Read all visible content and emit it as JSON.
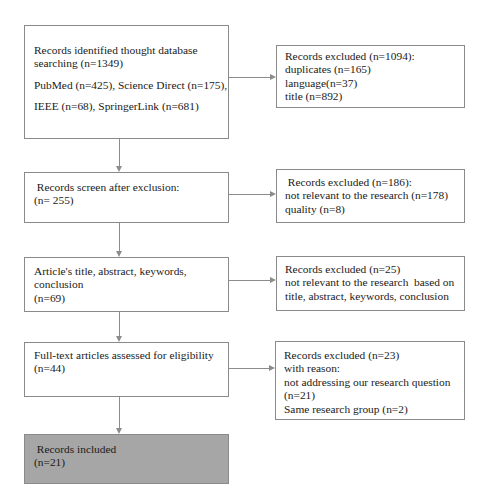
{
  "diagram": {
    "type": "PRISMA flow diagram",
    "main_flow": [
      {
        "id": "identified",
        "lines": [
          "Records identified thought database",
          "searching (n=1349)",
          "PubMed (n=425), Science Direct (n=175),",
          "IEEE (n=68), SpringerLink (n=681)"
        ],
        "filled": false
      },
      {
        "id": "screened",
        "lines": [
          " Records screen after exclusion:",
          "(n= 255)"
        ],
        "filled": false
      },
      {
        "id": "title-abstract",
        "lines": [
          "Article's title, abstract, keywords,",
          "conclusion",
          "(n=69)"
        ],
        "filled": false
      },
      {
        "id": "full-text",
        "lines": [
          "Full-text articles assessed for eligibility",
          "(n=44)"
        ],
        "filled": false
      },
      {
        "id": "included",
        "lines": [
          " Records included",
          "(n=21)"
        ],
        "filled": true,
        "fill_color": "#a6a6a6"
      }
    ],
    "exclusions": [
      {
        "id": "excluded-1",
        "lines": [
          "Records excluded (n=1094):",
          "duplicates (n=165)",
          "language(n=37)",
          "title (n=892)"
        ]
      },
      {
        "id": "excluded-2",
        "lines": [
          " Records excluded (n=186):",
          "not relevant to the research (n=178)",
          "quality (n=8)"
        ]
      },
      {
        "id": "excluded-3",
        "lines": [
          "Records excluded (n=25)",
          "not relevant to the research  based on",
          "title, abstract, keywords, conclusion"
        ]
      },
      {
        "id": "excluded-4",
        "lines": [
          "Records excluded (n=23)",
          "with reason:",
          "not addressing our research question",
          "(n=21)",
          "Same research group (n=2)"
        ]
      }
    ],
    "colors": {
      "border": "#8a8a8a",
      "connector": "#8c8c8c",
      "included_fill": "#a6a6a6",
      "text": "#1a1a1a"
    }
  }
}
